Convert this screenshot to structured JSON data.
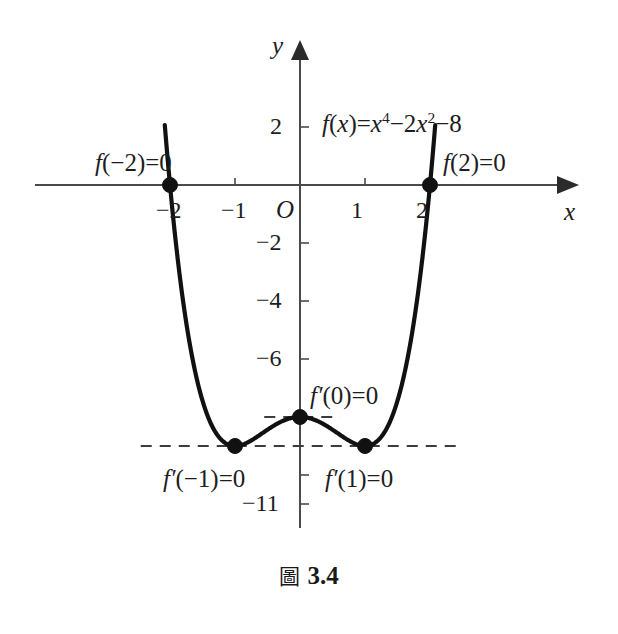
{
  "figure": {
    "caption_prefix": "圖",
    "caption_number": "3.4"
  },
  "equation": {
    "lhs": "f",
    "arg": "(x)",
    "equals": "=",
    "term1_base": "x",
    "term1_exp": "4",
    "op1": "−",
    "term2_coef": "2",
    "term2_base": "x",
    "term2_exp": "2",
    "op2": "−",
    "term3": "8",
    "full": "f(x)=x⁴−2x²−8"
  },
  "axes": {
    "x_label": "x",
    "y_label": "y",
    "origin_label": "O",
    "x_ticks": [
      {
        "value": -2,
        "label": "−2"
      },
      {
        "value": -1,
        "label": "−1"
      },
      {
        "value": 1,
        "label": "1"
      },
      {
        "value": 2,
        "label": "2"
      }
    ],
    "y_ticks": [
      {
        "value": 2,
        "label": "2"
      },
      {
        "value": -2,
        "label": "−2"
      },
      {
        "value": -4,
        "label": "−4"
      },
      {
        "value": -6,
        "label": "−6"
      },
      {
        "value": -10,
        "label": ""
      },
      {
        "value": -11,
        "label": "−11"
      }
    ],
    "xlim": [
      -2.55,
      2.6
    ],
    "ylim": [
      -11.6,
      2.9
    ]
  },
  "annotations": {
    "root_left": "f(−2)=0",
    "root_right": "f(2)=0",
    "crit_left": "f′(−1)=0",
    "crit_center": "f′(0)=0",
    "crit_right": "f′(1)=0"
  },
  "chart_data": {
    "type": "line",
    "title": "",
    "xlabel": "x",
    "ylabel": "y",
    "function": "f(x) = x^4 - 2x^2 - 8",
    "xlim": [
      -2.55,
      2.6
    ],
    "ylim": [
      -11.6,
      2.9
    ],
    "grid": false,
    "legend": "none",
    "domain_drawn": [
      -2.08,
      2.08
    ],
    "x": [
      -2.08,
      -2.0,
      -1.9,
      -1.8,
      -1.7,
      -1.6,
      -1.5,
      -1.4,
      -1.3,
      -1.2,
      -1.1,
      -1.0,
      -0.9,
      -0.8,
      -0.7,
      -0.6,
      -0.5,
      -0.4,
      -0.3,
      -0.2,
      -0.1,
      0.0,
      0.1,
      0.2,
      0.3,
      0.4,
      0.5,
      0.6,
      0.7,
      0.8,
      0.9,
      1.0,
      1.1,
      1.2,
      1.3,
      1.4,
      1.5,
      1.6,
      1.7,
      1.8,
      1.9,
      2.0,
      2.08
    ],
    "y": [
      1.06,
      0.0,
      -1.18,
      -2.02,
      -2.43,
      -2.56,
      -2.44,
      -2.08,
      -1.52,
      -0.8,
      -0.22,
      0.0,
      0.22,
      0.8,
      1.52,
      2.08,
      2.44,
      2.56,
      2.43,
      2.02,
      1.18,
      0.0,
      1.06,
      0.0,
      0.0,
      0.0,
      0.0,
      0.0,
      0.0,
      0.0,
      0.0,
      0.0,
      0.0,
      0.0,
      0.0,
      0.0,
      0.0,
      0.0,
      0.0,
      0.0,
      0.0,
      0.0,
      0.0
    ],
    "roots": [
      {
        "x": -2,
        "y": 0,
        "label": "f(−2)=0"
      },
      {
        "x": 2,
        "y": 0,
        "label": "f(2)=0"
      }
    ],
    "critical_points": [
      {
        "x": -1,
        "y": -9,
        "label": "f′(−1)=0",
        "kind": "local-minimum"
      },
      {
        "x": 0,
        "y": -8,
        "label": "f′(0)=0",
        "kind": "local-maximum"
      },
      {
        "x": 1,
        "y": -9,
        "label": "f′(1)=0",
        "kind": "local-minimum"
      }
    ],
    "tangent_lines": [
      {
        "y": -8,
        "x_from": -0.55,
        "x_to": 0.62,
        "style": "dashed"
      },
      {
        "y": -9,
        "x_from": -2.45,
        "x_to": 2.5,
        "style": "dashed"
      }
    ],
    "xticks": [
      -2,
      -1,
      1,
      2
    ],
    "yticks": [
      2,
      -2,
      -4,
      -6,
      -10,
      -11
    ]
  }
}
